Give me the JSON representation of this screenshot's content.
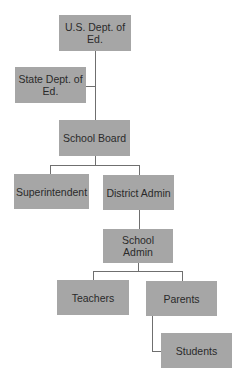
{
  "diagram": {
    "type": "org-chart",
    "nodes": [
      {
        "id": "us_dept_ed",
        "label": "U.S. Dept. of Ed."
      },
      {
        "id": "state_dept_ed",
        "label": "State Dept. of Ed."
      },
      {
        "id": "school_board",
        "label": "School Board"
      },
      {
        "id": "superintendent",
        "label": "Superintendent"
      },
      {
        "id": "district_admin",
        "label": "District Admin"
      },
      {
        "id": "school_admin",
        "label": "School Admin"
      },
      {
        "id": "teachers",
        "label": "Teachers"
      },
      {
        "id": "parents",
        "label": "Parents"
      },
      {
        "id": "students",
        "label": "Students"
      }
    ],
    "edges": [
      {
        "from": "us_dept_ed",
        "to": "state_dept_ed"
      },
      {
        "from": "us_dept_ed",
        "to": "school_board"
      },
      {
        "from": "school_board",
        "to": "superintendent"
      },
      {
        "from": "school_board",
        "to": "district_admin"
      },
      {
        "from": "district_admin",
        "to": "school_admin"
      },
      {
        "from": "school_admin",
        "to": "teachers"
      },
      {
        "from": "school_admin",
        "to": "parents"
      },
      {
        "from": "parents",
        "to": "students"
      }
    ],
    "colors": {
      "node_fill": "#a6a6a6",
      "node_text": "#2a2a2a",
      "connector": "#6f6f6f",
      "background": "#ffffff"
    }
  }
}
